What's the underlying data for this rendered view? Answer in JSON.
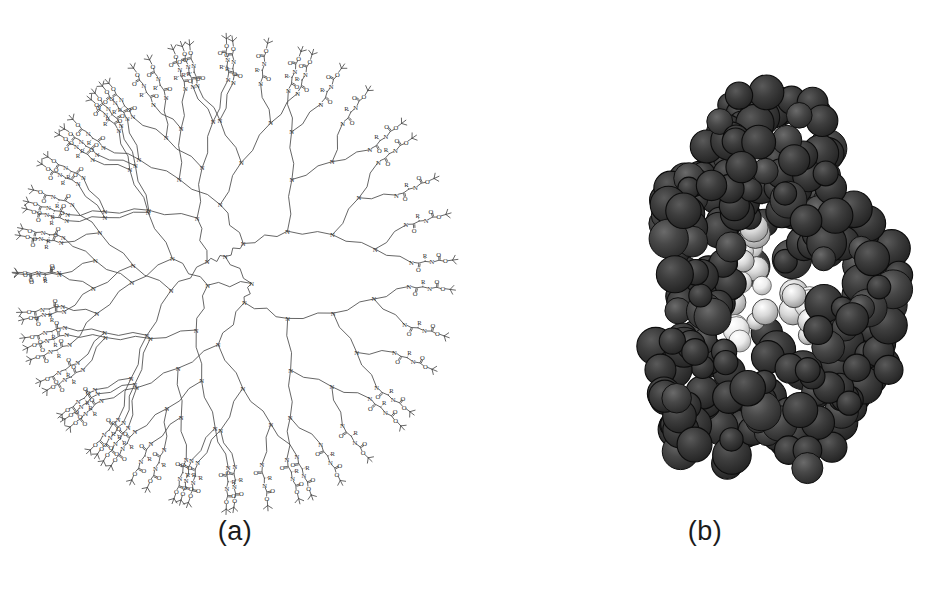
{
  "figure": {
    "background_color": "#ffffff",
    "width": 940,
    "height": 594,
    "panel_count": 2
  },
  "panels": [
    {
      "id": "a",
      "caption": "(a)",
      "kind": "2d-chemical-structure",
      "subject": "poly(propylene imine) dendrimer, 2D structural formula",
      "shape": "circular / elliptical radial branching diagram",
      "line_color": "#4a4a4a",
      "core": {
        "label": "N",
        "description": "diaminobutane (DAB) core with four branch arms"
      },
      "generations": 5,
      "terminal_group_count": 64,
      "atom_labels": [
        "N",
        "O",
        "R",
        "H"
      ],
      "repeat_unit": "N-CH2CH2CH2-N propylene amine spacer",
      "terminal_group": "Boc-protected amino acid (tert-butyl carbamate, O-C(=O)-N-CH(R)-C(=O)-N)",
      "terminal_glyph": "tert-butyl",
      "bounds": {
        "left": 22,
        "top": 40,
        "right": 448,
        "bottom": 508
      }
    },
    {
      "id": "b",
      "caption": "(b)",
      "kind": "3d-space-filling-model",
      "subject": "CPK space-filling molecular model of the same dendrimer",
      "outer_sphere_color": "#3a3a3a",
      "shadow_color": "#111111",
      "interior_sphere_color": "#e8e8e8",
      "highlight_color": "#f5f5f5",
      "sphere_count_visible": 320,
      "description": "dense globular cluster of dark gray spheres with a few light interior spheres visible through surface gaps",
      "bounds": {
        "left": 168,
        "top": 85,
        "right": 432,
        "bottom": 500
      }
    }
  ]
}
